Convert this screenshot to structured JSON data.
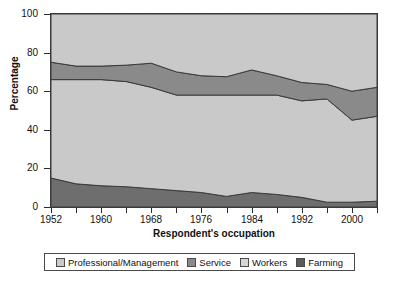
{
  "chart_data": {
    "type": "area",
    "title": "",
    "xlabel": "Respondent's occupation",
    "ylabel": "Percentage",
    "ylim": [
      0,
      100
    ],
    "xlim": [
      1952,
      2004
    ],
    "grid": false,
    "legend_position": "bottom",
    "stacked": true,
    "x": [
      1952,
      1956,
      1960,
      1964,
      1968,
      1972,
      1976,
      1980,
      1984,
      1988,
      1992,
      1996,
      2000,
      2004
    ],
    "y_ticks": [
      0,
      20,
      40,
      60,
      80,
      100
    ],
    "x_ticks": [
      1952,
      1956,
      1960,
      1964,
      1968,
      1972,
      1976,
      1980,
      1984,
      1988,
      1992,
      1996,
      2000,
      2004
    ],
    "x_tick_labels": [
      "1952",
      "",
      "1960",
      "",
      "1968",
      "",
      "1976",
      "",
      "1984",
      "",
      "1992",
      "",
      "2000",
      ""
    ],
    "series": [
      {
        "name": "Farming",
        "color": "#6e6e6e",
        "values": [
          15,
          12,
          11,
          10.5,
          9.5,
          8.5,
          7.5,
          5.5,
          7.5,
          6.5,
          5,
          2.5,
          2.5,
          3
        ]
      },
      {
        "name": "Workers",
        "color": "#c9c9c9",
        "values": [
          51,
          54,
          55,
          54.5,
          52.5,
          49.5,
          50.5,
          52.5,
          50.5,
          51.5,
          50,
          53.5,
          42.5,
          44
        ]
      },
      {
        "name": "Service",
        "color": "#8a8a8a",
        "values": [
          9,
          7,
          7,
          8.5,
          12.5,
          12,
          10,
          9.5,
          13,
          10,
          9.5,
          7.5,
          15,
          15
        ]
      },
      {
        "name": "Professional/Management",
        "color": "#c9c9c9",
        "values": [
          25,
          27,
          27,
          26.5,
          25.5,
          30,
          32,
          32.5,
          29,
          32,
          35.5,
          36.5,
          40,
          38
        ]
      }
    ],
    "legend_entries": [
      {
        "label": "Professional/Management",
        "color": "#c9c9c9"
      },
      {
        "label": "Service",
        "color": "#8a8a8a"
      },
      {
        "label": "Workers",
        "color": "#d6d6d6"
      },
      {
        "label": "Farming",
        "color": "#5a5a5a"
      }
    ]
  }
}
